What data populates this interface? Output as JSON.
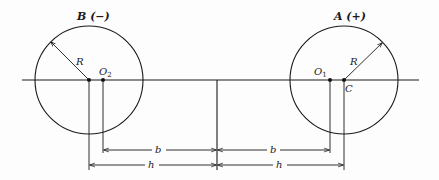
{
  "figure": {
    "left_circle": {
      "label": "B (−)",
      "radius_label": "R",
      "point_label_main": "O",
      "point_label_sub": "2"
    },
    "right_circle": {
      "label": "A (+)",
      "radius_label": "R",
      "point_label_main": "O",
      "point_label_sub": "1",
      "center_label": "C"
    },
    "dimensions": {
      "inner_label": "b",
      "outer_label": "h"
    }
  }
}
